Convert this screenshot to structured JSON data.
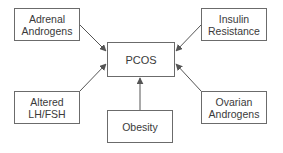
{
  "diagram": {
    "center": {
      "label": "PCOS"
    },
    "factors": [
      {
        "id": "adrenal",
        "label": "Adrenal\nAndrogens"
      },
      {
        "id": "insulin",
        "label": "Insulin\nResistance"
      },
      {
        "id": "lhfsh",
        "label": "Altered\nLH/FSH"
      },
      {
        "id": "obesity",
        "label": "Obesity"
      },
      {
        "id": "ovarian",
        "label": "Ovarian\nAndrogens"
      }
    ],
    "edges": [
      {
        "from": "adrenal",
        "to": "pcos"
      },
      {
        "from": "insulin",
        "to": "pcos"
      },
      {
        "from": "lhfsh",
        "to": "pcos"
      },
      {
        "from": "obesity",
        "to": "pcos"
      },
      {
        "from": "ovarian",
        "to": "pcos"
      }
    ],
    "colors": {
      "line": "#555555",
      "border": "#6b6b6b",
      "text": "#3a3a3a"
    }
  }
}
